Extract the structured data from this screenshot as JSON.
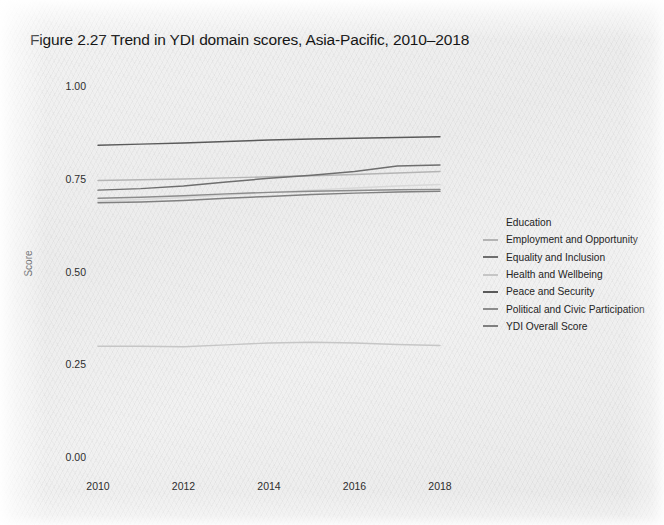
{
  "figure": {
    "title": "Figure 2.27   Trend in YDI domain scores, Asia-Pacific, 2010–2018"
  },
  "chart_data": {
    "type": "line",
    "title": "Figure 2.27   Trend in YDI domain scores, Asia-Pacific, 2010–2018",
    "xlabel": "",
    "ylabel": "Score",
    "x": [
      2010,
      2011,
      2012,
      2013,
      2014,
      2015,
      2016,
      2017,
      2018
    ],
    "xlim": [
      2010,
      2018
    ],
    "ylim": [
      0.0,
      1.0
    ],
    "xticks": [
      "2010",
      "2012",
      "2014",
      "2016",
      "2018"
    ],
    "yticks": [
      "0.00",
      "0.25",
      "0.50",
      "0.75",
      "1.00"
    ],
    "grid": false,
    "legend_position": "right",
    "series": [
      {
        "name": "Education",
        "color": "#d8d8d8",
        "values": [
          0.692,
          0.697,
          0.702,
          0.709,
          0.716,
          0.722,
          0.728,
          0.733,
          0.737
        ]
      },
      {
        "name": "Employment and Opportunity",
        "color": "#b4b4b4",
        "values": [
          0.748,
          0.75,
          0.752,
          0.755,
          0.758,
          0.761,
          0.764,
          0.768,
          0.772
        ]
      },
      {
        "name": "Equality and Inclusion",
        "color": "#6e6e6e",
        "values": [
          0.722,
          0.726,
          0.733,
          0.744,
          0.754,
          0.762,
          0.772,
          0.787,
          0.79
        ]
      },
      {
        "name": "Health and Wellbeing",
        "color": "#c6c6c6",
        "values": [
          0.301,
          0.301,
          0.3,
          0.305,
          0.31,
          0.312,
          0.31,
          0.306,
          0.303
        ]
      },
      {
        "name": "Peace and Security",
        "color": "#5a5a5a",
        "values": [
          0.843,
          0.846,
          0.849,
          0.853,
          0.857,
          0.86,
          0.862,
          0.864,
          0.866
        ]
      },
      {
        "name": "Political and Civic Participation",
        "color": "#8c8c8c",
        "values": [
          0.7,
          0.703,
          0.707,
          0.712,
          0.716,
          0.719,
          0.721,
          0.723,
          0.724
        ]
      },
      {
        "name": "YDI Overall Score",
        "color": "#808080",
        "values": [
          0.688,
          0.69,
          0.694,
          0.7,
          0.705,
          0.71,
          0.714,
          0.717,
          0.719
        ]
      }
    ]
  },
  "axes": {
    "y_label": "Score",
    "y_ticks": [
      {
        "label": "1.00",
        "value": 1.0
      },
      {
        "label": "0.75",
        "value": 0.75
      },
      {
        "label": "0.50",
        "value": 0.5
      },
      {
        "label": "0.25",
        "value": 0.25
      },
      {
        "label": "0.00",
        "value": 0.0
      }
    ],
    "x_ticks": [
      {
        "label": "2010",
        "value": 2010
      },
      {
        "label": "2012",
        "value": 2012
      },
      {
        "label": "2014",
        "value": 2014
      },
      {
        "label": "2016",
        "value": 2016
      },
      {
        "label": "2018",
        "value": 2018
      }
    ]
  },
  "legend": {
    "items": [
      {
        "label": "Education",
        "color": "#d8d8d8",
        "show_swatch": false
      },
      {
        "label": "Employment and Opportunity",
        "color": "#b4b4b4",
        "show_swatch": true
      },
      {
        "label": "Equality and Inclusion",
        "color": "#6e6e6e",
        "show_swatch": true
      },
      {
        "label": "Health and Wellbeing",
        "color": "#c6c6c6",
        "show_swatch": true
      },
      {
        "label": "Peace and Security",
        "color": "#5a5a5a",
        "show_swatch": true
      },
      {
        "label": "Political and Civic Participation",
        "color": "#8c8c8c",
        "show_swatch": true
      },
      {
        "label": "YDI Overall Score",
        "color": "#808080",
        "show_swatch": true
      }
    ]
  }
}
